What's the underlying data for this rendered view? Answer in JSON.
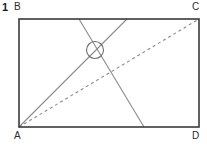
{
  "figure": {
    "number": "1",
    "canvas": {
      "width": 207,
      "height": 146,
      "background": "#ffffff"
    },
    "labels": {
      "top_left": "B",
      "top_right": "C",
      "bottom_left": "A",
      "bottom_right": "D"
    },
    "colors": {
      "rectangle_stroke": "#3a3a3a",
      "line_stroke": "#8a8a8a",
      "dashed_stroke": "#8a8a8a",
      "circle_stroke": "#6e6e6e",
      "label_text": "#2b2b2b",
      "number_text": "#1a1a1a"
    },
    "geometry": {
      "rectangle": {
        "x1": 19,
        "y1": 19,
        "x2": 199,
        "y2": 127,
        "stroke_width": 1.6
      },
      "vertices": {
        "A": {
          "x": 19,
          "y": 127
        },
        "B": {
          "x": 19,
          "y": 19
        },
        "C": {
          "x": 199,
          "y": 19
        },
        "D": {
          "x": 199,
          "y": 127
        }
      },
      "diagonal_dashed": {
        "x1": 19,
        "y1": 127,
        "x2": 199,
        "y2": 19,
        "dash_pattern": "3 3",
        "stroke_width": 1.1
      },
      "line_ascending": {
        "x1": 19,
        "y1": 127,
        "x2": 127,
        "y2": 19,
        "stroke_width": 1.1
      },
      "line_descending": {
        "x1": 79,
        "y1": 19,
        "x2": 144,
        "y2": 127,
        "stroke_width": 1.1
      },
      "intersection_circle": {
        "cx": 95,
        "cy": 50,
        "r": 8.5,
        "stroke_width": 1.1
      }
    }
  }
}
